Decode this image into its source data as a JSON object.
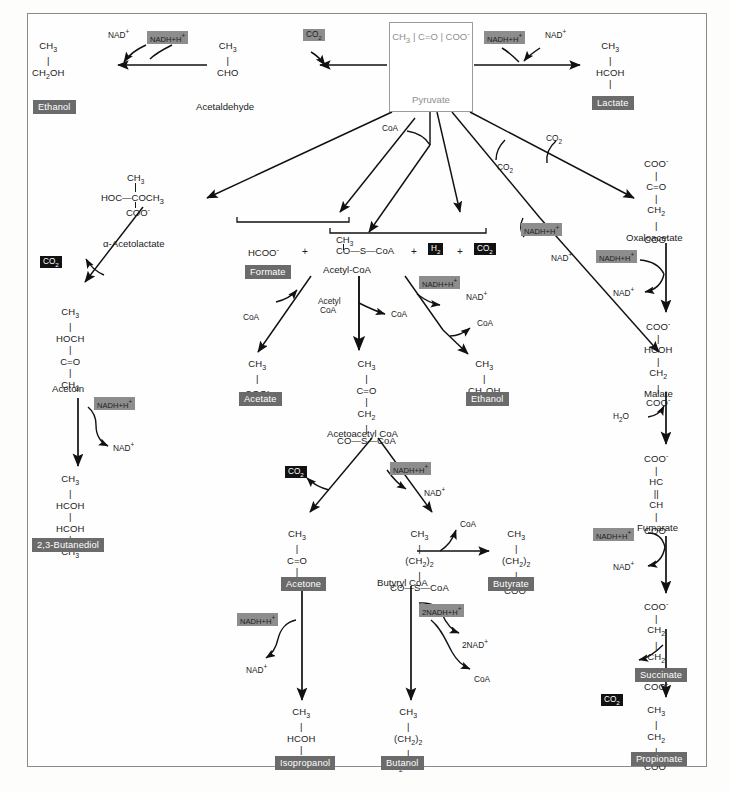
{
  "figure": {
    "type": "biochemical-pathway-diagram",
    "center_node": {
      "name": "Pyruvate",
      "formula_rows": [
        "CH3",
        "C=O",
        "COO-"
      ],
      "border_color": "#9b9b9b",
      "text_color": "#8f8f8f"
    },
    "colors": {
      "product_chip_bg": "#6b6b6b",
      "product_chip_fg": "#ffffff",
      "cofactor_chip_bg": "#8d8d8d",
      "gas_chip_bg": "#111111",
      "frame": "#8a8a8a",
      "arrow": "#111111"
    }
  },
  "products": {
    "ethanol_top": "Ethanol",
    "lactate": "Lactate",
    "formate": "Formate",
    "acetate": "Acetate",
    "ethanol_mid": "Ethanol",
    "butanediol": "2,3-Butanediol",
    "acetone": "Acetone",
    "butyrate": "Butyrate",
    "isopropanol": "Isopropanol",
    "butanol": "Butanol",
    "succinate": "Succinate",
    "propionate": "Propionate"
  },
  "intermediates": {
    "acetaldehyde": "Acetaldehyde",
    "acetolactate": "α-Acetolactate",
    "acetoin": "Acetoin",
    "acetyl_coa": "Acetyl-CoA",
    "acetoacetyl_coa": "Acetoacetyl CoA",
    "butyryl_coa": "Butyryl CoA",
    "oxaloacetate": "Oxaloacetate",
    "malate": "Malate",
    "fumarate": "Fumarate"
  },
  "molecules": {
    "ethanol_top": [
      "CH3",
      "CH2OH"
    ],
    "acetaldehyde": [
      "CH3",
      "CHO"
    ],
    "lactate": [
      "CH3",
      "HCOH",
      "COO-"
    ],
    "acetolactate_inline": "HOC—COCH3",
    "acetolactate_top": "CH3",
    "acetolactate_bottom": "COO-",
    "acetoin": [
      "CH3",
      "HOCH",
      "C=O",
      "CH3"
    ],
    "butanediol": [
      "CH3",
      "HCOH",
      "HCOH",
      "CH3"
    ],
    "formate_inline": "HCOO-",
    "acetyl_coa_top": "CH3",
    "acetyl_coa_inline": "CO—S—CoA",
    "acetate": [
      "CH3",
      "COO-"
    ],
    "acetoacetyl_coa": [
      "CH3",
      "C=O",
      "CH2",
      "CO—S—CoA"
    ],
    "ethanol_mid": [
      "CH3",
      "CH2OH"
    ],
    "acetone": [
      "CH3",
      "C=O",
      "CH3"
    ],
    "butyryl_coa": [
      "CH3",
      "(CH2)2",
      "CO—S—CoA"
    ],
    "butyrate": [
      "CH3",
      "(CH2)2",
      "COO-"
    ],
    "isopropanol": [
      "CH3",
      "HCOH",
      "CH3"
    ],
    "butanol": [
      "CH3",
      "(CH2)2",
      "H2COH"
    ],
    "oxaloacetate": [
      "COO-",
      "C=O",
      "CH2",
      "COO-"
    ],
    "malate": [
      "COO-",
      "HCOH",
      "CH2",
      "COO-"
    ],
    "fumarate": [
      "COO-",
      "HC",
      "CH",
      "COO-"
    ],
    "succinate": [
      "COO-",
      "CH2",
      "CH2",
      "COO-"
    ],
    "propionate": [
      "CH3",
      "CH2",
      "COO-"
    ]
  },
  "cofactors": {
    "nad_ox": "NAD+",
    "nadh": "NADH+H+",
    "nadh2": "2NADH+H+",
    "nad2": "2NAD+",
    "coa": "CoA",
    "acetyl_coa_short": [
      "Acetyl",
      "CoA"
    ],
    "water": "H2O",
    "co2": "CO2",
    "h2": "H2"
  },
  "gas_labels": {
    "co2_acetaldehyde_branch": {
      "text": "CO2",
      "style": "gray"
    },
    "co2_acetolactate": {
      "text": "CO2",
      "style": "black"
    },
    "co2_center": {
      "text": "CO2",
      "style": "black"
    },
    "h2_center": {
      "text": "H2",
      "style": "black"
    },
    "co2_acetoacetyl": {
      "text": "CO2",
      "style": "black"
    },
    "co2_succinate": {
      "text": "CO2",
      "style": "black"
    },
    "co2_plain_pyruvate_a": {
      "text": "CO2",
      "style": "plain"
    },
    "co2_plain_pyruvate_b": {
      "text": "CO2",
      "style": "plain"
    }
  },
  "operators": {
    "plus1": "+",
    "plus2": "+",
    "plus3": "+"
  }
}
